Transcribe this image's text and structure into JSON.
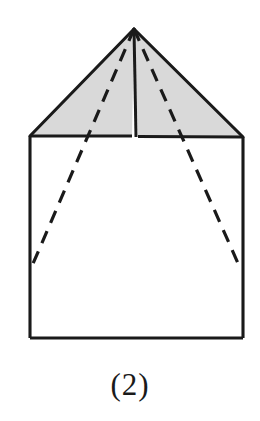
{
  "figure": {
    "caption": "(2)",
    "shape_name": "pyramid-on-prism",
    "colors": {
      "stroke": "#1a1a1a",
      "shade_fill": "#d9d9d9",
      "body_fill": "#ffffff",
      "background": "#ffffff",
      "caption_color": "#1a1a1a"
    },
    "stroke_widths": {
      "outline": 3.1,
      "ridge": 3.0,
      "dashed": 3.2
    },
    "dash_pattern": "13 9",
    "points": {
      "apex": [
        134,
        29
      ],
      "roof_left": [
        30,
        136
      ],
      "roof_right": [
        243,
        137
      ],
      "ridge_base_left": [
        132,
        136
      ],
      "ridge_base_right": [
        138,
        136
      ],
      "base_bottom_left": [
        30,
        338
      ],
      "base_bottom_right": [
        243,
        338
      ],
      "hidden_vertex_left": [
        32,
        266
      ],
      "hidden_vertex_right": [
        241,
        270
      ]
    },
    "parts": {
      "left_shaded_face": "left-pyramid-face",
      "right_shaded_face": "right-pyramid-face",
      "prism_body": "prism-front-face",
      "ridge_edge": "pyramid-ridge-edge",
      "hidden_edge_left": "hidden-edge-left",
      "hidden_edge_right": "hidden-edge-right"
    }
  }
}
